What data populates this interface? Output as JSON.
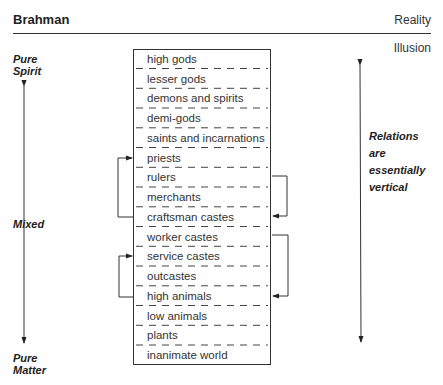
{
  "header": {
    "title": "Brahman",
    "right_top": "Reality",
    "right_bottom": "Illusion"
  },
  "left_axis": {
    "top_label": [
      "Pure",
      "Spirit"
    ],
    "middle_label": "Mixed",
    "bottom_label": [
      "Pure",
      "Matter"
    ]
  },
  "right_axis": {
    "label": [
      "Relations",
      "are",
      "essentially",
      "vertical"
    ]
  },
  "hierarchy": [
    "high gods",
    "lesser gods",
    "demons and spirits",
    "demi-gods",
    "saints and incarnations",
    "priests",
    "rulers",
    "merchants",
    "craftsman castes",
    "worker castes",
    "service castes",
    "outcastes",
    "high animals",
    "low animals",
    "plants",
    "inanimate world"
  ],
  "brackets": [
    {
      "side": "left",
      "from": "craftsman castes",
      "to": "priests"
    },
    {
      "side": "right",
      "from": "rulers",
      "to": "craftsman castes"
    },
    {
      "side": "left",
      "from": "high animals",
      "to": "service castes"
    },
    {
      "side": "right",
      "from": "worker castes",
      "to": "high animals"
    }
  ]
}
